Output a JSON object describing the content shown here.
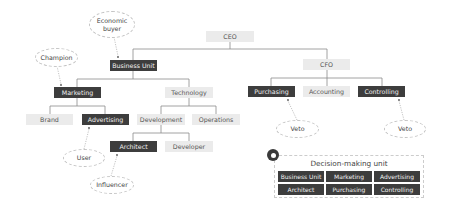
{
  "colors": {
    "decision_maker_fill": "#3d3d3d",
    "other_fill": "#ebebeb",
    "connector": "#8a8a8a",
    "role_border": "#c4c4c4"
  },
  "org_chart": {
    "ceo": "CEO",
    "business_unit": "Business Unit",
    "cfo": "CFO",
    "marketing": "Marketing",
    "technology": "Technology",
    "purchasing": "Purchasing",
    "accounting": "Accounting",
    "controlling": "Controlling",
    "brand": "Brand",
    "advertising": "Advertising",
    "development": "Development",
    "operations": "Operations",
    "architect": "Architect",
    "developer": "Developer"
  },
  "roles": {
    "economic_buyer_line1": "Economic",
    "economic_buyer_line2": "buyer",
    "champion": "Champion",
    "user": "User",
    "influencer": "Influencer",
    "veto_purchasing": "Veto",
    "veto_controlling": "Veto"
  },
  "decision_making_unit": {
    "title": "Decision-making unit",
    "members": [
      "Business Unit",
      "Marketing",
      "Advertising",
      "Architect",
      "Purchasing",
      "Controlling"
    ]
  }
}
